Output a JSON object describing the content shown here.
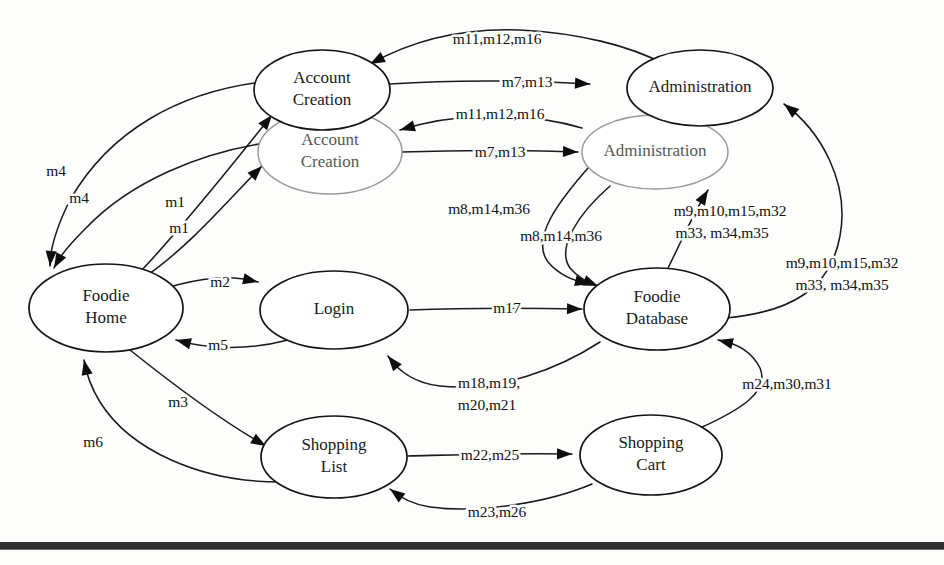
{
  "diagram": {
    "background_color": "#fdfdfc",
    "ink_color": "#141414",
    "ghost_color": "#9a9a9a",
    "nodes": [
      {
        "id": "account-creation-top",
        "label_line1": "Account",
        "label_line2": "Creation",
        "cx": 322,
        "cy": 90,
        "rx": 68,
        "ry": 40,
        "style": "main"
      },
      {
        "id": "account-creation-ghost",
        "label_line1": "Account",
        "label_line2": "Creation",
        "cx": 330,
        "cy": 152,
        "rx": 72,
        "ry": 42,
        "style": "ghost"
      },
      {
        "id": "administration-top",
        "label_line1": "Administration",
        "label_line2": "",
        "cx": 700,
        "cy": 88,
        "rx": 73,
        "ry": 38,
        "style": "main"
      },
      {
        "id": "administration-ghost",
        "label_line1": "Administration",
        "label_line2": "",
        "cx": 655,
        "cy": 152,
        "rx": 73,
        "ry": 37,
        "style": "ghost"
      },
      {
        "id": "foodie-home",
        "label_line1": "Foodie",
        "label_line2": "Home",
        "cx": 106,
        "cy": 308,
        "rx": 77,
        "ry": 44,
        "style": "main"
      },
      {
        "id": "login",
        "label_line1": "Login",
        "label_line2": "",
        "cx": 334,
        "cy": 310,
        "rx": 74,
        "ry": 39,
        "style": "main"
      },
      {
        "id": "foodie-database",
        "label_line1": "Foodie",
        "label_line2": "Database",
        "cx": 657,
        "cy": 309,
        "rx": 73,
        "ry": 41,
        "style": "main"
      },
      {
        "id": "shopping-list",
        "label_line1": "Shopping",
        "label_line2": "List",
        "cx": 334,
        "cy": 457,
        "rx": 73,
        "ry": 41,
        "style": "main"
      },
      {
        "id": "shopping-cart",
        "label_line1": "Shopping",
        "label_line2": "Cart",
        "cx": 651,
        "cy": 455,
        "rx": 71,
        "ry": 40,
        "style": "main"
      }
    ],
    "edges": [
      {
        "id": "e-ac-to-admin-top-return",
        "label": "m11,m12,m16",
        "label_x": 497,
        "label_y": 40,
        "path": "M 370 64 C 420 36 470 28 520 30 C 580 33 630 46 664 64",
        "arrow_at": "start",
        "arrow_angle": 160
      },
      {
        "id": "e-ac-to-admin-top",
        "label": "m7,m13",
        "label_x": 527,
        "label_y": 83,
        "path": "M 390 84 C 450 80 520 80 590 84",
        "arrow_at": "end",
        "arrow_angle": 5
      },
      {
        "id": "e-ac-ghost-to-admin-ghost-return",
        "label": "m11,m12,m16",
        "label_x": 500,
        "label_y": 115,
        "path": "M 400 130 C 450 114 520 110 582 128",
        "arrow_at": "start",
        "arrow_angle": 158
      },
      {
        "id": "e-ac-ghost-to-admin-ghost",
        "label": "m7,m13",
        "label_x": 500,
        "label_y": 153,
        "path": "M 402 152 C 460 150 520 150 578 152",
        "arrow_at": "end",
        "arrow_angle": 2
      },
      {
        "id": "e-home-to-ac-top-m1",
        "label": "m1",
        "label_x": 175,
        "label_y": 203,
        "path": "M 140 272 C 180 230 230 168 272 115",
        "arrow_at": "end",
        "arrow_angle": -51
      },
      {
        "id": "e-home-to-ac-ghost-m1",
        "label": "m1",
        "label_x": 179,
        "label_y": 229,
        "path": "M 146 276 C 190 246 230 198 262 166",
        "arrow_at": "end",
        "arrow_angle": -42
      },
      {
        "id": "e-ac-top-to-home-m4",
        "label": "m4",
        "label_x": 56,
        "label_y": 172,
        "path": "M 262 82 C 180 92 110 130 70 200 C 56 228 50 250 50 266",
        "arrow_at": "end",
        "arrow_angle": 85
      },
      {
        "id": "e-ac-ghost-to-home-m4",
        "label": "m4",
        "label_x": 79,
        "label_y": 199,
        "path": "M 272 142 C 200 152 130 182 86 228 C 68 246 58 258 54 268",
        "arrow_at": "end",
        "arrow_angle": 75
      },
      {
        "id": "e-admin-to-db-m8",
        "label": "m8,m14,m36",
        "label_x": 489,
        "label_y": 210,
        "path": "M 588 168 C 560 200 530 238 548 262 C 560 276 578 282 590 284",
        "arrow_at": "end",
        "arrow_angle": 20
      },
      {
        "id": "e-admin-ghost-to-db-m8",
        "label": "m8,m14,m36",
        "label_x": 561,
        "label_y": 237,
        "path": "M 610 186 C 578 214 556 248 570 268 C 580 280 592 284 598 286",
        "arrow_at": "end",
        "arrow_angle": 22
      },
      {
        "id": "e-db-to-admin-ghost",
        "label": "m9,m10,m15,m32",
        "label_x": 730,
        "label_y": 212,
        "label2": "m33, m34,m35",
        "label2_x": 722,
        "label2_y": 234,
        "path": "M 668 268 C 682 240 694 212 708 190",
        "arrow_at": "end",
        "arrow_angle": -58
      },
      {
        "id": "e-db-to-admin-top",
        "label": "m9,m10,m15,m32",
        "label_x": 842,
        "label_y": 264,
        "label2": "m33, m34,m35",
        "label2_x": 842,
        "label2_y": 286,
        "path": "M 726 318 C 790 312 830 290 840 236 C 850 182 820 130 784 104",
        "arrow_at": "end",
        "arrow_angle": -140
      },
      {
        "id": "e-home-to-login-m2",
        "label": "m2",
        "label_x": 220,
        "label_y": 283,
        "path": "M 166 288 C 200 278 230 274 258 282",
        "arrow_at": "end",
        "arrow_angle": 12
      },
      {
        "id": "e-login-to-home-m5",
        "label": "m5",
        "label_x": 218,
        "label_y": 346,
        "path": "M 288 340 C 250 350 210 350 176 340",
        "arrow_at": "end",
        "arrow_angle": 192
      },
      {
        "id": "e-login-to-db-m17",
        "label": "m17",
        "label_x": 507,
        "label_y": 309,
        "path": "M 410 310 C 460 308 530 308 582 309",
        "arrow_at": "end",
        "arrow_angle": 1
      },
      {
        "id": "e-db-to-login-m18",
        "label": "m18,m19,",
        "label_x": 489,
        "label_y": 384,
        "label2": "m20,m21",
        "label2_x": 487,
        "label2_y": 406,
        "path": "M 600 342 C 560 368 500 392 440 386 C 412 383 396 368 388 356",
        "arrow_at": "end",
        "arrow_angle": 214
      },
      {
        "id": "e-home-to-list-m3",
        "label": "m3",
        "label_x": 178,
        "label_y": 403,
        "path": "M 130 350 C 170 382 220 420 266 446",
        "arrow_at": "end",
        "arrow_angle": 30
      },
      {
        "id": "e-list-to-home-m6",
        "label": "m6",
        "label_x": 93,
        "label_y": 443,
        "path": "M 280 482 C 200 482 130 450 100 402 C 90 386 86 372 84 360",
        "arrow_at": "end",
        "arrow_angle": -100
      },
      {
        "id": "e-list-to-cart-m22",
        "label": "m22,m25",
        "label_x": 490,
        "label_y": 456,
        "path": "M 408 456 C 450 455 500 453 572 454",
        "arrow_at": "end",
        "arrow_angle": 1
      },
      {
        "id": "e-cart-to-list-m23",
        "label": "m23,m26",
        "label_x": 497,
        "label_y": 513,
        "path": "M 592 484 C 550 502 480 514 430 507 C 410 504 398 496 390 489",
        "arrow_at": "end",
        "arrow_angle": 215
      },
      {
        "id": "e-cart-to-db-m24",
        "label": "m24,m30,m31",
        "label_x": 787,
        "label_y": 385,
        "path": "M 700 428 C 740 410 770 392 760 368 C 750 348 730 342 718 340",
        "arrow_at": "end",
        "arrow_angle": 188
      }
    ],
    "bottom_rule": {
      "y": 542,
      "height": 7,
      "color": "#2e2e2e"
    }
  }
}
